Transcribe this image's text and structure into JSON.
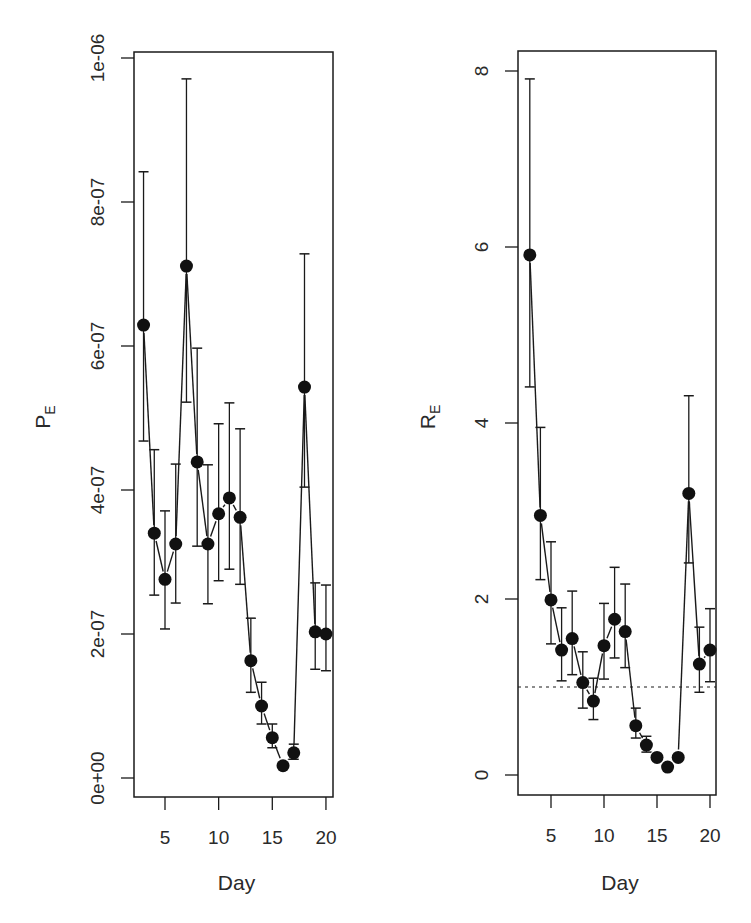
{
  "chart_data": [
    {
      "type": "line",
      "panel": "left",
      "title": "",
      "xlabel": "Day",
      "ylabel": "P_E",
      "ylabel_main": "P",
      "ylabel_sub": "E",
      "xlim": [
        2.5,
        20.5
      ],
      "ylim": [
        -4e-08,
        1.05e-06
      ],
      "xticks": [
        5,
        10,
        15,
        20
      ],
      "xtick_labels": [
        "5",
        "10",
        "15",
        "20"
      ],
      "yticks": [
        0,
        2e-07,
        4e-07,
        6e-07,
        8e-07,
        1e-06
      ],
      "ytick_labels": [
        "0e+00",
        "2e-07",
        "4e-07",
        "6e-07",
        "8e-07",
        "1e-06"
      ],
      "grid": false,
      "legend": null,
      "x": [
        3,
        4,
        5,
        6,
        7,
        8,
        9,
        10,
        11,
        12,
        13,
        14,
        15,
        16,
        17,
        18,
        19,
        20
      ],
      "series": [
        {
          "name": "P_E",
          "values": [
            6.29e-07,
            3.4e-07,
            2.76e-07,
            3.25e-07,
            7.11e-07,
            4.39e-07,
            3.25e-07,
            3.67e-07,
            3.89e-07,
            3.62e-07,
            1.63e-07,
            1e-07,
            5.6e-08,
            1.7e-08,
            3.5e-08,
            5.43e-07,
            2.03e-07,
            2e-07
          ],
          "upper": [
            8.42e-07,
            4.56e-07,
            3.71e-07,
            4.36e-07,
            9.71e-07,
            5.97e-07,
            4.35e-07,
            4.92e-07,
            5.21e-07,
            4.85e-07,
            2.22e-07,
            1.33e-07,
            7.5e-08,
            null,
            4.7e-08,
            7.28e-07,
            2.71e-07,
            2.68e-07
          ],
          "lower": [
            4.68e-07,
            2.54e-07,
            2.07e-07,
            2.43e-07,
            5.22e-07,
            3.22e-07,
            2.42e-07,
            2.74e-07,
            2.9e-07,
            2.69e-07,
            1.19e-07,
            7.5e-08,
            4.2e-08,
            null,
            2.6e-08,
            4.04e-07,
            1.51e-07,
            1.49e-07
          ]
        }
      ]
    },
    {
      "type": "line",
      "panel": "right",
      "title": "",
      "xlabel": "Day",
      "ylabel": "R_E",
      "ylabel_main": "R",
      "ylabel_sub": "E",
      "xlim": [
        2.5,
        20.5
      ],
      "ylim": [
        -0.3,
        8.25
      ],
      "xticks": [
        5,
        10,
        15,
        20
      ],
      "xtick_labels": [
        "5",
        "10",
        "15",
        "20"
      ],
      "yticks": [
        0,
        2,
        4,
        6,
        8
      ],
      "ytick_labels": [
        "0",
        "2",
        "4",
        "6",
        "8"
      ],
      "grid": false,
      "legend": null,
      "reference_line": {
        "y": 1,
        "style": "dotted"
      },
      "x": [
        3,
        4,
        5,
        6,
        7,
        8,
        9,
        10,
        11,
        12,
        13,
        14,
        15,
        16,
        17,
        18,
        19,
        20
      ],
      "series": [
        {
          "name": "R_E",
          "values": [
            5.91,
            2.95,
            1.99,
            1.42,
            1.55,
            1.05,
            0.84,
            1.47,
            1.77,
            1.63,
            0.56,
            0.34,
            0.2,
            0.09,
            0.2,
            3.2,
            1.26,
            1.42
          ],
          "upper": [
            7.91,
            3.95,
            2.65,
            1.9,
            2.09,
            1.4,
            1.1,
            1.95,
            2.36,
            2.17,
            0.76,
            0.44,
            null,
            null,
            null,
            4.31,
            1.68,
            1.89
          ],
          "lower": [
            4.41,
            2.22,
            1.49,
            1.07,
            1.14,
            0.76,
            0.63,
            1.09,
            1.33,
            1.22,
            0.42,
            0.26,
            null,
            null,
            null,
            2.41,
            0.94,
            1.06
          ]
        }
      ]
    }
  ],
  "layout": {
    "panels": [
      {
        "box": [
          134,
          52,
          333,
          797
        ],
        "x_at5": 165,
        "px_per_day": 10.73,
        "y_zero": 778,
        "px_per_unit": 720000000.0
      },
      {
        "box": [
          518,
          51,
          716,
          795
        ],
        "x_at5": 551,
        "px_per_day": 10.6,
        "y_zero": 775,
        "px_per_unit": 88
      }
    ],
    "colors": {
      "ink": "#1a1a1a",
      "background": "#ffffff"
    }
  }
}
